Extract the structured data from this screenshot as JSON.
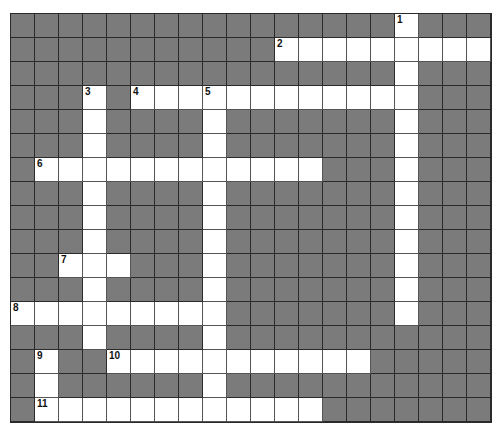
{
  "puzzle": {
    "cols": 20,
    "rows": 17,
    "colors": {
      "block": "#7b7b7b",
      "open": "#ffffff",
      "grid_line": "#2a2a2a"
    },
    "entries": [
      {
        "number": "1",
        "direction": "down",
        "row": 0,
        "col": 16,
        "length": 13
      },
      {
        "number": "2",
        "direction": "across",
        "row": 1,
        "col": 11,
        "length": 9
      },
      {
        "number": "3",
        "direction": "down",
        "row": 3,
        "col": 3,
        "length": 11
      },
      {
        "number": "4",
        "direction": "across",
        "row": 3,
        "col": 5,
        "length": 12
      },
      {
        "number": "5",
        "direction": "down",
        "row": 3,
        "col": 8,
        "length": 14
      },
      {
        "number": "6",
        "direction": "across",
        "row": 6,
        "col": 1,
        "length": 12
      },
      {
        "number": "7",
        "direction": "across",
        "row": 10,
        "col": 2,
        "length": 3
      },
      {
        "number": "8",
        "direction": "across",
        "row": 12,
        "col": 0,
        "length": 9
      },
      {
        "number": "9",
        "direction": "down",
        "row": 14,
        "col": 1,
        "length": 3
      },
      {
        "number": "10",
        "direction": "across",
        "row": 14,
        "col": 4,
        "length": 11
      },
      {
        "number": "11",
        "direction": "across",
        "row": 16,
        "col": 1,
        "length": 12
      }
    ]
  }
}
